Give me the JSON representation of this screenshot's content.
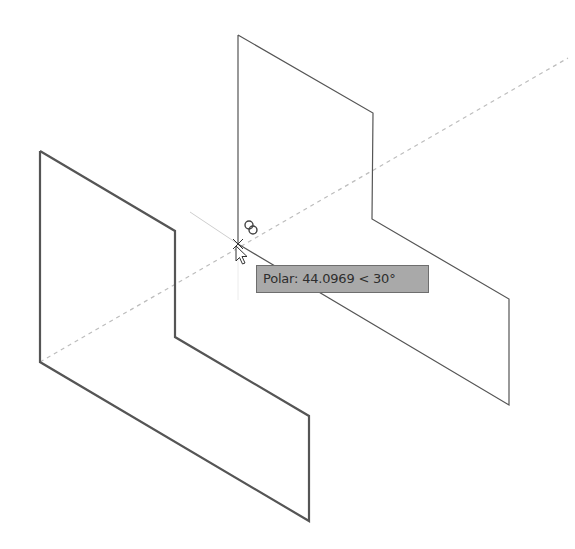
{
  "viewport": {
    "background": "#ffffff",
    "object_color": "#555555",
    "tracking_line_color": "#bbbbbb"
  },
  "objects": {
    "left_panel": {
      "points": "40,151 175,231 175,337 309,416 309,521 40,362 40,151",
      "stroke_width": 2.2
    },
    "right_panel": {
      "points": "238,35 373,113 372,219 509,299 509,405 238,244 238,35",
      "stroke_width": 1.2
    }
  },
  "tracking": {
    "polar_line": {
      "x1": 40,
      "y1": 362,
      "x2": 568,
      "y2": 58
    },
    "crosshair_line": {
      "x1": 190,
      "y1": 212,
      "x2": 238,
      "y2": 244
    },
    "vertical_extension": {
      "x1": 238,
      "y1": 244,
      "x2": 238,
      "y2": 300
    }
  },
  "cursor": {
    "x": 238,
    "y": 244,
    "icon": "arrow-cursor-icon"
  },
  "snap_marker": {
    "icon": "intersection-snap-icon",
    "cx1": 249,
    "cy1": 225,
    "cx2": 253,
    "cy2": 230,
    "r": 4
  },
  "tooltip": {
    "text": "Polar: 44.0969 < 30°",
    "label": "Polar:",
    "distance": "44.0969",
    "angle": "30°"
  }
}
